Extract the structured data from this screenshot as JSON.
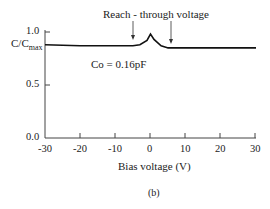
{
  "chart_data": {
    "type": "line",
    "title": "",
    "xlabel": "Bias voltage (V)",
    "ylabel": "C/C_max",
    "ylabel_main": "C/C",
    "ylabel_sub": "max",
    "xlim": [
      -30,
      30
    ],
    "ylim": [
      0.0,
      1.0
    ],
    "x_ticks": [
      "-30",
      "-20",
      "-10",
      "0",
      "10",
      "20",
      "30"
    ],
    "y_ticks": [
      "0.0",
      "0.5",
      "1.0"
    ],
    "grid": false,
    "legend": null,
    "series": [
      {
        "name": "C/Cmax",
        "x": [
          -30,
          -20,
          -10,
          -5,
          -3,
          -1,
          0,
          1,
          3,
          5,
          6,
          10,
          20,
          30
        ],
        "y": [
          0.88,
          0.87,
          0.87,
          0.87,
          0.88,
          0.92,
          0.98,
          0.93,
          0.87,
          0.85,
          0.85,
          0.85,
          0.85,
          0.85
        ]
      }
    ],
    "annotations": [
      {
        "text": "Reach - through voltage",
        "arrows_at_x": [
          -5,
          6
        ]
      },
      {
        "text": "Co = 0.16pF"
      }
    ],
    "caption": "(b)"
  }
}
